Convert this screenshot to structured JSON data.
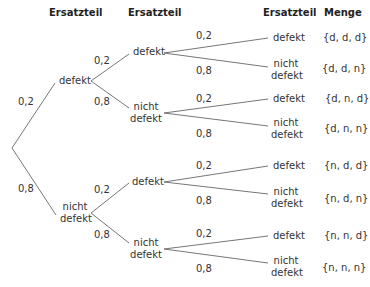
{
  "headers": {
    "level1": "Ersatzteil",
    "level2": "Ersatzteil",
    "level3": "Ersatzteil",
    "set": "Menge"
  },
  "labels": {
    "defekt": "defekt",
    "nicht": "nicht",
    "defekt2": "defekt"
  },
  "tree": {
    "root_probs": [
      "0,2",
      "0,8"
    ],
    "level1": [
      {
        "label": "defekt",
        "probs": [
          "0,2",
          "0,8"
        ]
      },
      {
        "label": "nicht defekt",
        "probs": [
          "0,2",
          "0,8"
        ]
      }
    ],
    "level2": [
      {
        "label": "defekt",
        "probs": [
          "0,2",
          "0,8"
        ]
      },
      {
        "label": "nicht defekt",
        "probs": [
          "0,2",
          "0,8"
        ]
      },
      {
        "label": "defekt",
        "probs": [
          "0,2",
          "0,8"
        ]
      },
      {
        "label": "nicht defekt",
        "probs": [
          "0,2",
          "0,8"
        ]
      }
    ],
    "leaves": [
      {
        "label": "defekt",
        "set": "{d, d, d}"
      },
      {
        "label": "nicht defekt",
        "set": "{d, d, n}"
      },
      {
        "label": "defekt",
        "set": "{d, n, d}"
      },
      {
        "label": "nicht defekt",
        "set": "{d, n, n}"
      },
      {
        "label": "defekt",
        "set": "{n, d, d}"
      },
      {
        "label": "nicht defekt",
        "set": "{n, d, n}"
      },
      {
        "label": "defekt",
        "set": "{n, n, d}"
      },
      {
        "label": "nicht defekt",
        "set": "{n, n, n}"
      }
    ]
  }
}
